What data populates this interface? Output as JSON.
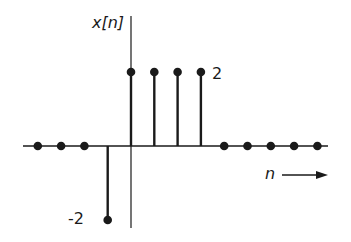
{
  "chart_data": {
    "type": "stem",
    "title": "",
    "ylabel": "x[n]",
    "xlabel": "n",
    "x": [
      -4,
      -3,
      -2,
      -1,
      0,
      1,
      2,
      3,
      4,
      5,
      6,
      7,
      8
    ],
    "values": [
      0,
      0,
      0,
      -2,
      2,
      2,
      2,
      2,
      0,
      0,
      0,
      0,
      0
    ],
    "annotations": [
      {
        "text": "2",
        "at_value": 2
      },
      {
        "text": "-2",
        "at_value": -2
      }
    ],
    "ylim": [
      -2,
      2
    ],
    "grid": false,
    "legend": null,
    "xaxis_arrow": true
  },
  "labels": {
    "ylabel": "x[n]",
    "xlabel": "n",
    "pos_annotation": "2",
    "neg_annotation": "-2"
  },
  "colors": {
    "ink": "#1a1a1a",
    "background": "#ffffff"
  }
}
